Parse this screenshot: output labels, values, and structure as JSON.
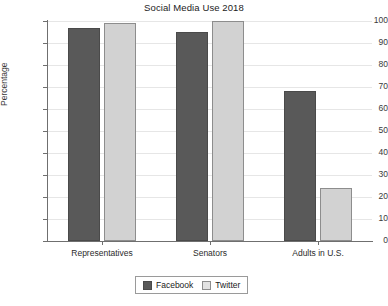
{
  "chart_data": {
    "type": "bar",
    "title": "Social Media Use 2018",
    "xlabel": "",
    "ylabel": "Percentage",
    "ylim": [
      0,
      100
    ],
    "ytick_step": 10,
    "yticks": [
      100,
      90,
      80,
      70,
      60,
      50,
      40,
      30,
      20,
      10,
      0
    ],
    "grid": true,
    "legend_position": "bottom-center",
    "categories": [
      "Representatives",
      "Senators",
      "Adults in U.S."
    ],
    "series": [
      {
        "name": "Facebook",
        "color": "#595959",
        "values": [
          97,
          95,
          68
        ]
      },
      {
        "name": "Twitter",
        "color": "#d2d2d2",
        "values": [
          99,
          100,
          24
        ]
      }
    ]
  },
  "legend": {
    "items": [
      {
        "label": "Facebook"
      },
      {
        "label": "Twitter"
      }
    ]
  }
}
